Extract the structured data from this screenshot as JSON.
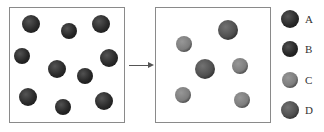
{
  "diagram": {
    "before": {
      "particles": [
        {
          "type": "A",
          "cx": 31,
          "cy": 24,
          "r": 9
        },
        {
          "type": "B",
          "cx": 69,
          "cy": 31,
          "r": 8
        },
        {
          "type": "A",
          "cx": 101,
          "cy": 24,
          "r": 9
        },
        {
          "type": "B",
          "cx": 22,
          "cy": 56,
          "r": 8
        },
        {
          "type": "A",
          "cx": 57,
          "cy": 69,
          "r": 9
        },
        {
          "type": "B",
          "cx": 85,
          "cy": 76,
          "r": 8
        },
        {
          "type": "A",
          "cx": 109,
          "cy": 58,
          "r": 9
        },
        {
          "type": "A",
          "cx": 28,
          "cy": 97,
          "r": 9
        },
        {
          "type": "B",
          "cx": 63,
          "cy": 107,
          "r": 8
        },
        {
          "type": "A",
          "cx": 104,
          "cy": 101,
          "r": 9
        }
      ]
    },
    "after": {
      "particles": [
        {
          "type": "D",
          "cx": 228,
          "cy": 30,
          "r": 10
        },
        {
          "type": "C",
          "cx": 184,
          "cy": 44,
          "r": 8
        },
        {
          "type": "D",
          "cx": 205,
          "cy": 69,
          "r": 10
        },
        {
          "type": "C",
          "cx": 240,
          "cy": 66,
          "r": 8
        },
        {
          "type": "C",
          "cx": 183,
          "cy": 95,
          "r": 8
        },
        {
          "type": "C",
          "cx": 242,
          "cy": 100,
          "r": 8
        }
      ]
    },
    "arrow": "→",
    "legend": [
      {
        "label": "A",
        "color": "#2a2a2a",
        "r": 9
      },
      {
        "label": "B",
        "color": "#262626",
        "r": 8
      },
      {
        "label": "C",
        "color": "#7d7d7d",
        "r": 8
      },
      {
        "label": "D",
        "color": "#4f4f4f",
        "r": 9
      }
    ],
    "colors": {
      "A": "#2a2a2a",
      "B": "#262626",
      "C": "#7d7d7d",
      "D": "#4f4f4f"
    }
  }
}
